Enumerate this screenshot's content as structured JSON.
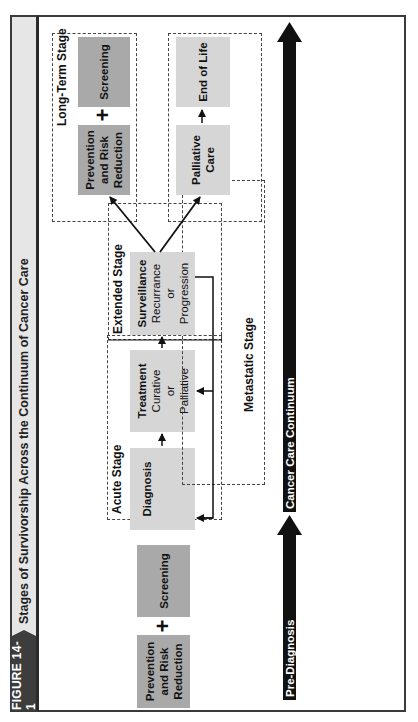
{
  "figure": {
    "label": "FIGURE 14-1",
    "title": "Stages of Survivorship Across the Continuum of Cancer Care"
  },
  "timeline": {
    "pre_diagnosis_label": "Pre-Diagnosis",
    "continuum_label": "Cancer Care Continuum"
  },
  "pre_diagnosis": {
    "prevention": {
      "line1": "Prevention",
      "line2": "and Risk",
      "line3": "Reduction"
    },
    "plus": "+",
    "screening": "Screening"
  },
  "stages": {
    "acute": {
      "label": "Acute Stage",
      "diagnosis": "Diagnosis",
      "treatment": {
        "title": "Treatment",
        "line1": "Curative",
        "line2": "or",
        "line3": "Palliative"
      }
    },
    "extended": {
      "label": "Extended Stage",
      "surveillance": {
        "title": "Surveillance",
        "line1": "Recurrance",
        "line2": "or",
        "line3": "Progression"
      }
    },
    "metastatic": {
      "label": "Metastatic Stage"
    },
    "long_term": {
      "label": "Long-Term Stage",
      "prevention": {
        "line1": "Prevention",
        "line2": "and Risk",
        "line3": "Reduction"
      },
      "plus": "+",
      "screening": "Screening"
    },
    "end_of_life": {
      "palliative_care": {
        "line1": "Palliative",
        "line2": "Care"
      },
      "end_of_life": "End of Life"
    }
  },
  "colors": {
    "dark_box": "#a9a9a9",
    "light_box": "#d6d6d6",
    "title_bar": "#e6e6e6",
    "figure_label_bg": "#3d3d3d",
    "arrow": "#111111"
  }
}
